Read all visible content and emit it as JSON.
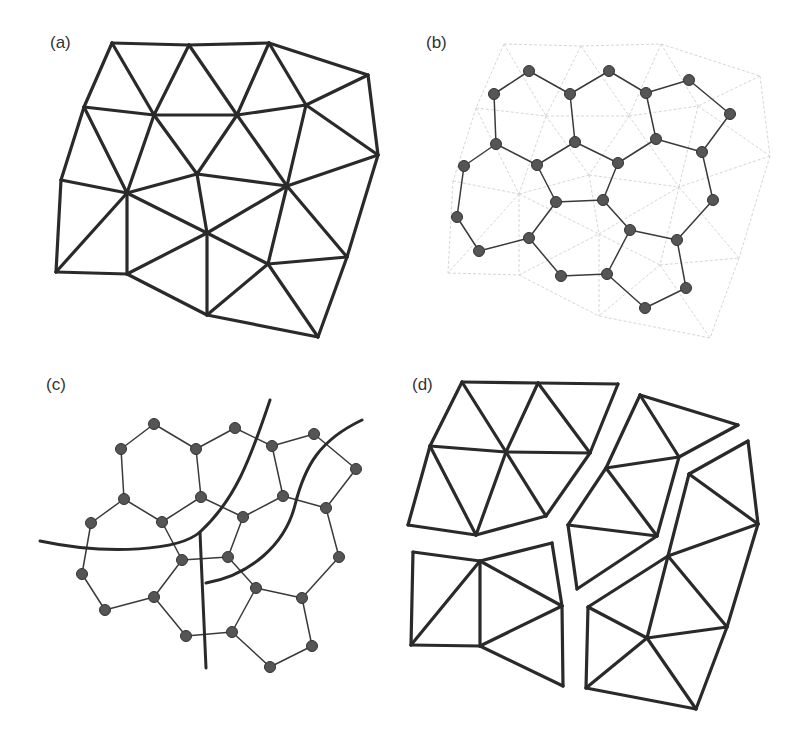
{
  "figure": {
    "panels": [
      {
        "id": "a",
        "label": "(a)",
        "description": "triangular mesh"
      },
      {
        "id": "b",
        "label": "(b)",
        "description": "dual polygon graph overlaid on faint mesh"
      },
      {
        "id": "c",
        "label": "(c)",
        "description": "dual graph cut by three fracture curves"
      },
      {
        "id": "d",
        "label": "(d)",
        "description": "mesh fractured into four fragments"
      }
    ],
    "colors": {
      "stroke": "#2a2a2a",
      "node": "#555555",
      "faint_mesh": "#d6d6d6",
      "background": "#ffffff"
    }
  }
}
